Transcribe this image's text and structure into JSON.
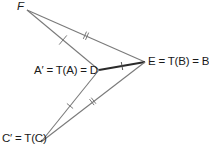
{
  "diagram": {
    "colors": {
      "line": "#7a7a7a",
      "thick_line": "#2a2a2a",
      "text": "#1a1a1a"
    },
    "points": {
      "F": {
        "x": 27,
        "y": 10
      },
      "D": {
        "x": 99,
        "y": 70
      },
      "E": {
        "x": 145,
        "y": 62
      },
      "C_prime": {
        "x": 41,
        "y": 142
      }
    },
    "labels": {
      "F": "F",
      "D": "A′ = T(A) = D",
      "E": "E = T(B) = B′",
      "C_prime": "C′ = T(C)"
    },
    "segments": [
      {
        "from": "F",
        "to": "D",
        "ticks": 1,
        "style": "thin"
      },
      {
        "from": "F",
        "to": "E",
        "ticks": 2,
        "style": "thin"
      },
      {
        "from": "D",
        "to": "E",
        "ticks": 1,
        "style": "thick"
      },
      {
        "from": "D",
        "to": "C_prime",
        "ticks": 1,
        "style": "thin"
      },
      {
        "from": "E",
        "to": "C_prime",
        "ticks": 2,
        "style": "thin"
      }
    ]
  }
}
